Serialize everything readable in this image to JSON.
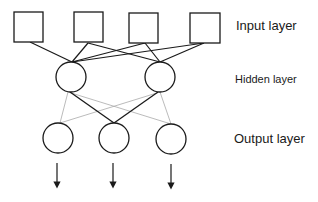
{
  "diagram": {
    "type": "neural-network",
    "labels": {
      "input": "Input layer",
      "hidden": "Hidden layer",
      "output": "Output layer"
    },
    "layers": {
      "input": {
        "node_shape": "square",
        "count": 4
      },
      "hidden": {
        "node_shape": "circle",
        "count": 2
      },
      "output": {
        "node_shape": "circle",
        "count": 3
      }
    },
    "edges": {
      "input_to_hidden": [
        [
          1,
          1
        ],
        [
          2,
          1
        ],
        [
          2,
          2
        ],
        [
          3,
          1
        ],
        [
          3,
          2
        ],
        [
          4,
          1
        ],
        [
          4,
          2
        ]
      ],
      "hidden_to_output_strong": [
        [
          1,
          2
        ],
        [
          2,
          2
        ]
      ],
      "hidden_to_output_weak": [
        [
          1,
          1
        ],
        [
          1,
          3
        ],
        [
          2,
          1
        ],
        [
          2,
          3
        ]
      ]
    },
    "outputs_arrows": 3,
    "colors": {
      "stroke": "#1a1a1a",
      "weak_edge": "#aaaaaa",
      "background": "#ffffff"
    }
  }
}
